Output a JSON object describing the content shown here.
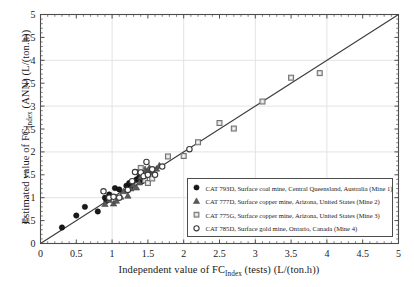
{
  "chart_data": {
    "type": "scatter",
    "title": "",
    "xlabel_parts": {
      "pre": "Independent value of FC",
      "sub": "Index",
      "post": " (tests) (L/(ton.h))"
    },
    "ylabel_parts": {
      "pre": "Estimated value of FC",
      "sub": "Index",
      "post": " (ANN) (L/(ton.h))"
    },
    "xlim": [
      0,
      5
    ],
    "ylim": [
      0,
      5
    ],
    "xticks": [
      0,
      0.5,
      1,
      1.5,
      2,
      2.5,
      3,
      3.5,
      4,
      4.5,
      5
    ],
    "yticks": [
      0,
      0.5,
      1,
      1.5,
      2,
      2.5,
      3,
      3.5,
      4,
      4.5,
      5
    ],
    "xtick_labels": [
      "0",
      "0.5",
      "1",
      "1.5",
      "2",
      "2.5",
      "3",
      "3.5",
      "4",
      "4.5",
      "5"
    ],
    "ytick_labels": [
      "0",
      "0.5",
      "1",
      "1.5",
      "2",
      "2.5",
      "3",
      "3.5",
      "4",
      "4.5",
      "5"
    ],
    "grid": true,
    "grid_major_step": 1,
    "minor_ticks": true,
    "legend_position": "lower-right",
    "reference_line": {
      "type": "identity",
      "from": [
        0,
        0
      ],
      "to": [
        5,
        5
      ],
      "color": "#3a3a3a"
    },
    "series": [
      {
        "name": "CAT 793D, Surface coal mine, Central Queensland, Australia (Mine 1)",
        "marker": "filled-circle",
        "color": "#1a1a1a",
        "points": [
          [
            0.3,
            0.35
          ],
          [
            0.5,
            0.61
          ],
          [
            0.62,
            0.8
          ],
          [
            0.8,
            0.7
          ],
          [
            0.9,
            1.0
          ],
          [
            0.92,
            0.93
          ],
          [
            0.96,
            1.07
          ],
          [
            1.04,
            1.21
          ],
          [
            1.1,
            1.18
          ],
          [
            1.2,
            1.26
          ],
          [
            1.24,
            1.32
          ],
          [
            1.26,
            1.22
          ],
          [
            1.34,
            1.4
          ],
          [
            1.38,
            1.45
          ],
          [
            1.42,
            1.36
          ],
          [
            1.46,
            1.43
          ]
        ]
      },
      {
        "name": "CAT 777D, Surface copper mine, Arizona, United States (Mine 2)",
        "marker": "filled-triangle",
        "color": "#5a5a5a",
        "points": [
          [
            0.9,
            0.86
          ],
          [
            0.96,
            0.95
          ],
          [
            1.02,
            0.87
          ],
          [
            1.06,
            0.93
          ],
          [
            1.12,
            1.02
          ],
          [
            1.16,
            1.14
          ],
          [
            1.22,
            1.04
          ],
          [
            1.26,
            1.2
          ],
          [
            1.3,
            1.28
          ],
          [
            1.34,
            1.22
          ],
          [
            1.38,
            1.33
          ],
          [
            1.4,
            1.45
          ],
          [
            1.44,
            1.53
          ],
          [
            1.46,
            1.62
          ],
          [
            1.5,
            1.58
          ],
          [
            1.52,
            1.65
          ],
          [
            1.58,
            1.55
          ],
          [
            1.62,
            1.63
          ],
          [
            1.66,
            1.7
          ]
        ]
      },
      {
        "name": "CAT 775G, Surface copper mine, Arizona, United States (Mine 3)",
        "marker": "open-square",
        "color": "#6e6e6e",
        "points": [
          [
            1.34,
            1.56
          ],
          [
            1.4,
            1.65
          ],
          [
            1.46,
            1.38
          ],
          [
            1.5,
            1.32
          ],
          [
            1.56,
            1.42
          ],
          [
            1.78,
            1.9
          ],
          [
            2.0,
            1.91
          ],
          [
            2.2,
            2.21
          ],
          [
            2.5,
            2.63
          ],
          [
            2.7,
            2.51
          ],
          [
            3.1,
            3.1
          ],
          [
            3.5,
            3.62
          ],
          [
            3.9,
            3.72
          ]
        ]
      },
      {
        "name": "CAT 785D, Surface gold mine, Ontario, Canada (Mine 4)",
        "marker": "open-circle",
        "color": "#3a3a3a",
        "points": [
          [
            0.88,
            1.14
          ],
          [
            0.96,
            1.0
          ],
          [
            1.02,
            1.02
          ],
          [
            1.1,
            1.0
          ],
          [
            1.22,
            1.17
          ],
          [
            1.28,
            1.36
          ],
          [
            1.32,
            1.56
          ],
          [
            1.4,
            1.55
          ],
          [
            1.44,
            1.47
          ],
          [
            1.48,
            1.78
          ],
          [
            1.5,
            1.5
          ],
          [
            1.56,
            1.62
          ],
          [
            1.6,
            1.5
          ],
          [
            1.7,
            1.68
          ],
          [
            2.08,
            2.06
          ]
        ]
      }
    ]
  },
  "legend": {
    "entries": [
      {
        "marker": "filled-circle",
        "label": "CAT 793D, Surface coal mine, Central Queensland, Australia (Mine 1)"
      },
      {
        "marker": "filled-triangle",
        "label": "CAT 777D, Surface copper mine, Arizona, United States (Mine 2)"
      },
      {
        "marker": "open-square",
        "label": "CAT 775G, Surface copper mine, Arizona, United States (Mine 3)"
      },
      {
        "marker": "open-circle",
        "label": "CAT 785D, Surface gold mine, Ontario, Canada (Mine 4)"
      }
    ]
  },
  "colors": {
    "axis": "#4d4d4d",
    "grid": "#e3e3e3",
    "text": "#1a1a1a",
    "background": "#ffffff"
  }
}
